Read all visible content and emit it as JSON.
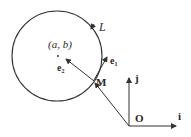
{
  "diagram": {
    "curve_label": "L",
    "center_label": "(a, b)",
    "point_label": "M",
    "origin_label": "O",
    "unit_x_label": "i",
    "unit_y_label": "j",
    "tangent_label": "e",
    "tangent_sub": "1",
    "normal_label": "e",
    "normal_sub": "2",
    "stroke_color": "#333333"
  }
}
